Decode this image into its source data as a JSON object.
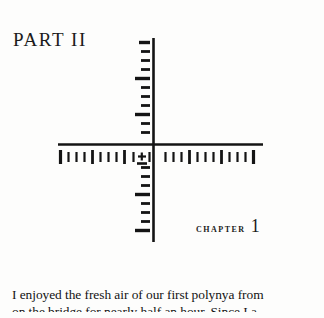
{
  "page": {
    "background_color": "#fdfdfc",
    "ink_color": "#1b1b1b"
  },
  "part_heading": {
    "text": "PART II"
  },
  "chapter_label": {
    "word": "CHAPTER",
    "number": "1"
  },
  "reticle": {
    "description": "crosshair-reticle-with-graduated-scales",
    "line_color": "#141414",
    "center": {
      "x": 153,
      "y": 144
    },
    "vertical_axis": {
      "x": 153,
      "top": 38,
      "bottom": 242
    },
    "horizontal_axis": {
      "y": 144,
      "left": 58,
      "right": 263
    },
    "vertical_ticks": {
      "side": "left",
      "short_length": 11,
      "long_length": 17,
      "spacing": 9.2,
      "major_every": 4,
      "count_above": 11,
      "count_below": 10
    },
    "horizontal_ticks": {
      "side": "below",
      "row_y": 153,
      "short_height": 9,
      "long_height": 14,
      "spacing": 7.6,
      "major_every": 4,
      "count_left": 13,
      "count_right": 13
    },
    "center_marker": {
      "type": "plus-in-brackets",
      "offset_x": -12,
      "offset_y": 10
    }
  },
  "body_text": {
    "lines": [
      "I enjoyed the fresh air of our first polynya from",
      "on the bridge for nearly half an hour. Since I a"
    ]
  }
}
